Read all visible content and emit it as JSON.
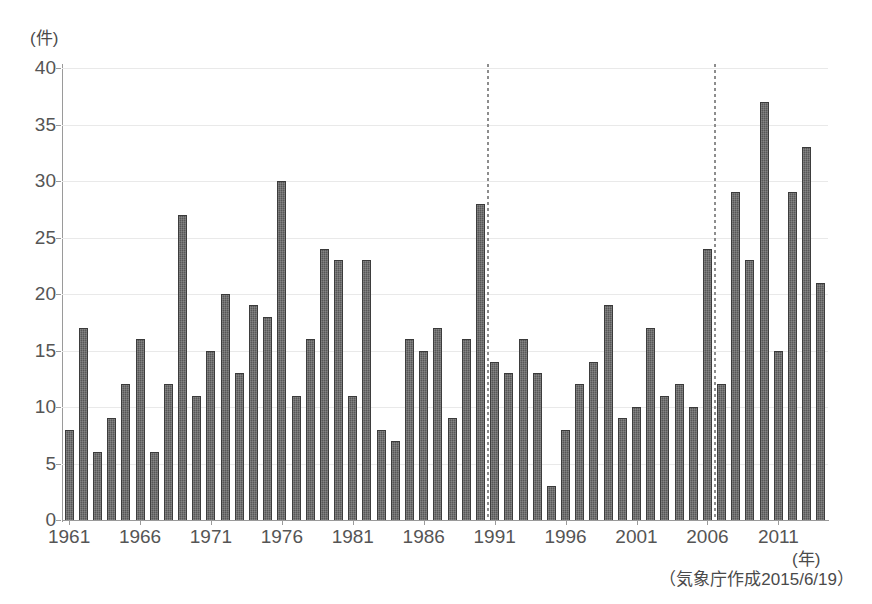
{
  "chart_data": {
    "type": "bar",
    "title": "",
    "subtitle": "",
    "xlabel": "(年)",
    "ylabel": "(件)",
    "ylim": [
      0,
      40
    ],
    "ytick_step": 5,
    "yticks": [
      0,
      5,
      10,
      15,
      20,
      25,
      30,
      35,
      40
    ],
    "grid": true,
    "legend": null,
    "xtick_labels": [
      "1961",
      "1966",
      "1971",
      "1976",
      "1981",
      "1986",
      "1991",
      "1996",
      "2001",
      "2006",
      "2011"
    ],
    "categories": [
      "1961",
      "1962",
      "1963",
      "1964",
      "1965",
      "1966",
      "1967",
      "1968",
      "1969",
      "1970",
      "1971",
      "1972",
      "1973",
      "1974",
      "1975",
      "1976",
      "1977",
      "1978",
      "1979",
      "1980",
      "1981",
      "1982",
      "1983",
      "1984",
      "1985",
      "1986",
      "1987",
      "1988",
      "1989",
      "1990",
      "1991",
      "1992",
      "1993",
      "1994",
      "1995",
      "1996",
      "1997",
      "1998",
      "1999",
      "2000",
      "2001",
      "2002",
      "2003",
      "2004",
      "2005",
      "2006",
      "2007",
      "2008",
      "2009",
      "2010",
      "2011",
      "2012",
      "2013",
      "2014"
    ],
    "values": [
      8,
      17,
      6,
      9,
      12,
      16,
      6,
      12,
      27,
      11,
      15,
      20,
      13,
      19,
      18,
      30,
      11,
      16,
      24,
      23,
      11,
      23,
      8,
      7,
      16,
      15,
      17,
      9,
      16,
      28,
      14,
      13,
      16,
      13,
      3,
      8,
      12,
      14,
      19,
      9,
      10,
      17,
      11,
      12,
      10,
      24,
      12,
      29,
      23,
      37,
      15,
      29,
      33,
      21
    ],
    "annotations": [
      {
        "type": "vertical-dotted-line",
        "after_category": "1990"
      },
      {
        "type": "vertical-dotted-line",
        "after_category": "2006"
      }
    ],
    "bar_color": "#575757",
    "gridline_color": "#e9e9e9",
    "axis_color": "#9a9a9a"
  },
  "footer": {
    "credit": "（気象庁作成2015/6/19）"
  }
}
